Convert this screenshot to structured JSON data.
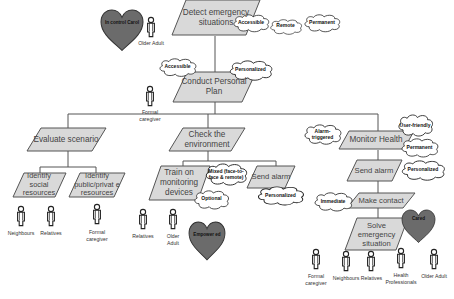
{
  "diagram": {
    "processes": {
      "detect": "Detect emergency situations",
      "conduct": "Conduct Personal Plan",
      "evaluate": "Evaluate scenario",
      "check": "Check the environment",
      "monitor": "Monitor Health",
      "identify_social": "Identify social resources",
      "identify_public": "Identify public/privat e resources",
      "train": "Train on monitoring devices",
      "send_alarm_mid": "Send alarm",
      "send_alarm_right": "Send alarm",
      "make_contact": "Make contact",
      "solve": "Solve emergency situation"
    },
    "clouds": {
      "detect_accessible": "Accessible",
      "detect_remote": "Remote",
      "detect_permanent": "Permanent",
      "conduct_accessible": "Accessible",
      "conduct_personalized": "Personalized",
      "train_mixed": "Mixed (face-to-face & remote)",
      "train_optional": "Optional",
      "send_mid_personalized": "Personalized",
      "monitor_alarm": "Alarm-triggered",
      "monitor_user": "User-friendly",
      "monitor_permanent": "Permanent",
      "send_right_personalized": "Personalized",
      "contact_immediate": "Immediate"
    },
    "hearts": {
      "top": "In control Carol",
      "mid": "Empower ed",
      "right": "Cared"
    },
    "people": {
      "older_adult_top": "Older Adult",
      "formal_caregiver_top": "Formal caregiver",
      "neighbours_left": "Neighbours",
      "relatives_left": "Relatives",
      "formal_caregiver_left": "Formal caregiver",
      "relatives_mid": "Relatives",
      "older_adult_mid": "Older Adult",
      "formal_caregiver_right": "Formal caregiver",
      "neighbours_right": "Neighbours",
      "relatives_right": "Relatives",
      "health_professionals": "Health Professionals",
      "older_adult_right": "Older Adult"
    },
    "colors": {
      "process_fill": "#d9d9d9",
      "process_stroke": "#555555",
      "heart_fill": "#6b6b6b",
      "line": "#555555"
    }
  }
}
